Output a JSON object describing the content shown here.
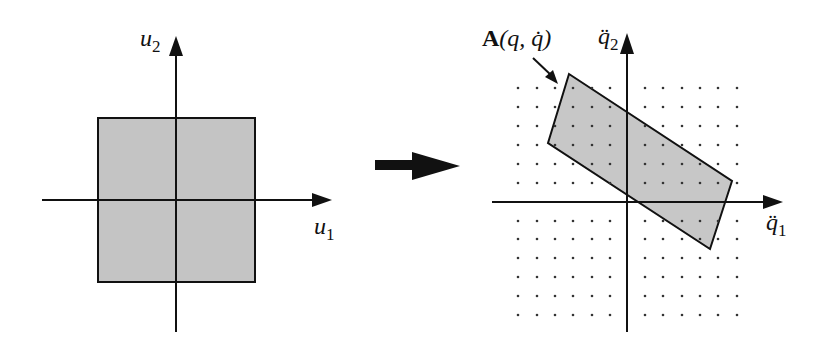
{
  "figure": {
    "left_panel": {
      "x_axis_label": "u",
      "x_axis_sub": "1",
      "y_axis_label": "u",
      "y_axis_sub": "2",
      "shape": "square",
      "fill_color": "#c4c4c4",
      "stroke_color": "#111111"
    },
    "transform_arrow": {
      "icon": "right-arrow-icon",
      "color": "#111111"
    },
    "right_panel": {
      "x_axis_label": "q̈",
      "x_axis_sub": "1",
      "y_axis_label": "q̈",
      "y_axis_sub": "2",
      "shape": "parallelogram",
      "shape_label_bold": "A",
      "shape_label_args": "(q, q̇)",
      "fill_color": "#c4c4c4",
      "stroke_color": "#111111",
      "grid": "dot lattice"
    }
  }
}
